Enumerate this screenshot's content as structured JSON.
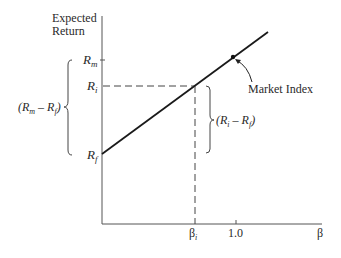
{
  "diagram": {
    "type": "security-market-line",
    "y_axis_label_line1": "Expected",
    "y_axis_label_line2": "Return",
    "x_axis_label": "β",
    "y_ticks": {
      "rm": {
        "main": "R",
        "sub": "m"
      },
      "ri": {
        "main": "R",
        "sub": "i"
      },
      "rf": {
        "main": "R",
        "sub": "f"
      }
    },
    "x_ticks": {
      "beta_i": {
        "main": "β",
        "sub": "i"
      },
      "one": "1.0"
    },
    "left_brace_label": {
      "open": "(R",
      "sub1": "m",
      "mid": " – R",
      "sub2": "f",
      "close": ")"
    },
    "right_brace_label": {
      "open": "(R",
      "sub1": "i",
      "mid": " – R",
      "sub2": "f",
      "close": ")"
    },
    "annotation": "Market Index",
    "colors": {
      "line": "#1a1a1a",
      "axis": "#555555",
      "dashed": "#444444",
      "text": "#2a2a2a"
    }
  }
}
